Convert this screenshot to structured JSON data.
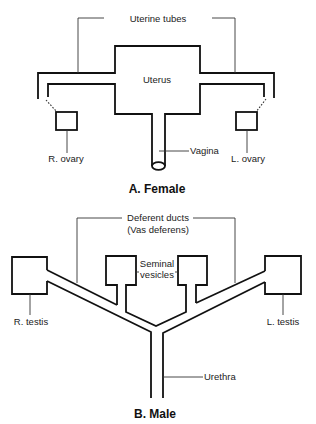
{
  "female": {
    "title": "A. Female",
    "labels": {
      "uterine_tubes": "Uterine tubes",
      "uterus": "Uterus",
      "vagina": "Vagina",
      "right_ovary": "R. ovary",
      "left_ovary": "L. ovary"
    }
  },
  "male": {
    "title": "B. Male",
    "labels": {
      "deferent_ducts": "Deferent ducts",
      "vas_deferens": "(Vas deferens)",
      "seminal": "Seminal",
      "vesicles": "vesicles",
      "right_testis": "R. testis",
      "left_testis": "L. testis",
      "urethra": "Urethra"
    }
  },
  "colors": {
    "background": "#ffffff",
    "line": "#111111",
    "text": "#222222"
  }
}
